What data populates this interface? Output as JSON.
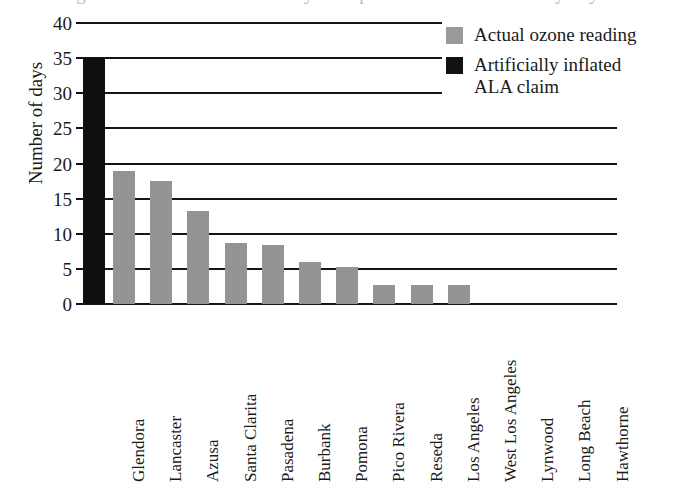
{
  "figure": {
    "title_cutoff": "Figure 1. Ozone exceedance days compared with ALA claims by city",
    "y_axis_label": "Number of days",
    "y_ticks": [
      "40",
      "35",
      "30",
      "25",
      "20",
      "15",
      "10",
      "5",
      "0"
    ]
  },
  "legend": {
    "position": "top-right",
    "items": [
      {
        "label_lines": [
          "Actual ozone reading"
        ],
        "swatch": "gray-swatch",
        "color": "#9a9a9a"
      },
      {
        "label_lines": [
          "Artificially inflated",
          "ALA claim"
        ],
        "swatch": "black-swatch",
        "color": "#121212"
      }
    ]
  },
  "chart_data": {
    "type": "bar",
    "title": "",
    "xlabel": "",
    "ylabel": "Number of days",
    "ylim": [
      0,
      40
    ],
    "ytick_step": 5,
    "grid": true,
    "legend_position": "top-right",
    "categories": [
      "Glendora",
      "Lancaster",
      "Azusa",
      "Santa Clarita",
      "Pasadena",
      "Burbank",
      "Pomona",
      "Pico Rivera",
      "Reseda",
      "Los Angeles",
      "West Los Angeles",
      "Lynwood",
      "Long Beach",
      "Hawthorne"
    ],
    "series": [
      {
        "name": "Artificially inflated ALA claim",
        "color": "#121212",
        "values": [
          35,
          0,
          0,
          0,
          0,
          0,
          0,
          0,
          0,
          0,
          0,
          0,
          0,
          0
        ],
        "note": "single black bar drawn at the left edge of the axis"
      },
      {
        "name": "Actual ozone reading",
        "color": "#949494",
        "values": [
          19,
          17.5,
          13.3,
          8.7,
          8.4,
          6,
          5.2,
          2.7,
          2.7,
          2.7,
          0,
          0,
          0,
          0
        ]
      }
    ]
  },
  "colors": {
    "gray_bar": "#949494",
    "black_bar": "#121212",
    "axis": "#16161a",
    "background": "#ffffff"
  }
}
